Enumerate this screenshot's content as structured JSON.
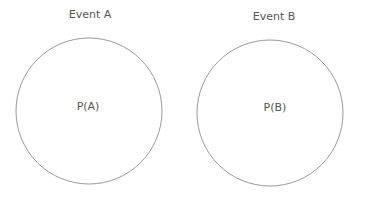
{
  "diagram": {
    "events": [
      {
        "title": "Event A",
        "label": "P(A)"
      },
      {
        "title": "Event B",
        "label": "P(B)"
      }
    ]
  }
}
